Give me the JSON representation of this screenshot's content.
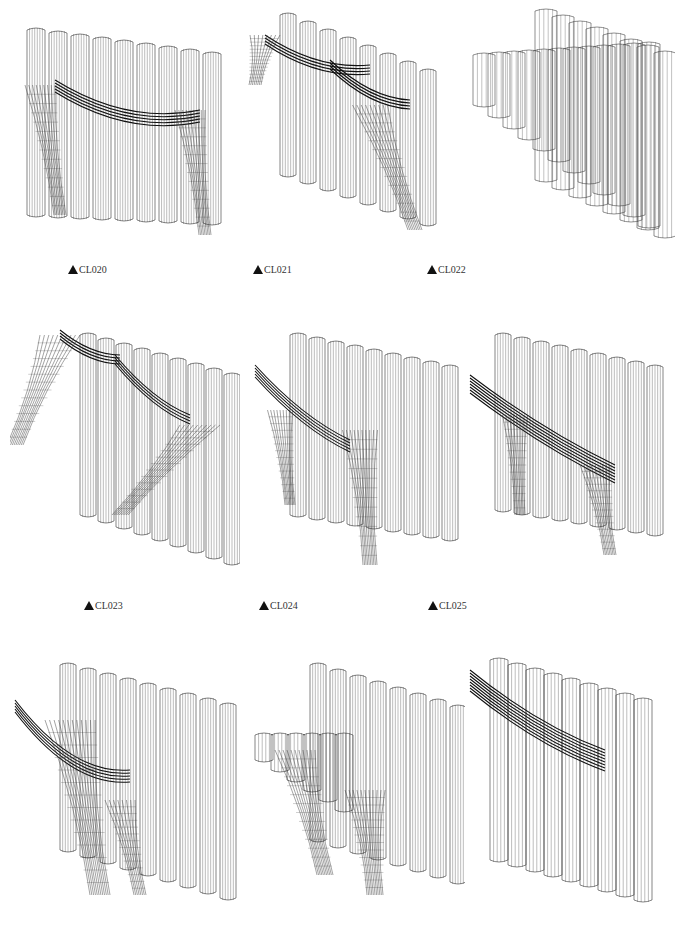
{
  "page": {
    "background": "#ffffff",
    "line_color": "#222222"
  },
  "items": [
    {
      "code": "CL020",
      "label": "CL020",
      "has_label": true
    },
    {
      "code": "CL021",
      "label": "CL021",
      "has_label": true
    },
    {
      "code": "CL022",
      "label": "CL022",
      "has_label": true
    },
    {
      "code": "CL023",
      "label": "CL023",
      "has_label": true
    },
    {
      "code": "CL024",
      "label": "CL024",
      "has_label": true
    },
    {
      "code": "CL025",
      "label": "CL025",
      "has_label": true
    },
    {
      "code": "",
      "label": "",
      "has_label": false
    },
    {
      "code": "",
      "label": "",
      "has_label": false
    },
    {
      "code": "",
      "label": "",
      "has_label": false
    }
  ],
  "label_prefix_icon": "triangle-up-icon"
}
